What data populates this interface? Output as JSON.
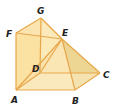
{
  "diagram": {
    "type": "3d-solid-geometry",
    "colors": {
      "edge": "#e8a74a",
      "face_light": "#fbe6b4",
      "face_mid": "#f7d48a",
      "face_dark": "#e9c36a",
      "face_shadow": "#d8bb6a",
      "label": "#222222"
    },
    "vertices": {
      "A": {
        "label": "A",
        "x": 16,
        "y": 90
      },
      "B": {
        "label": "B",
        "x": 75,
        "y": 90
      },
      "C": {
        "label": "C",
        "x": 100,
        "y": 73
      },
      "D": {
        "label": "D",
        "x": 40,
        "y": 73
      },
      "E": {
        "label": "E",
        "x": 62,
        "y": 39
      },
      "F": {
        "label": "F",
        "x": 16,
        "y": 33
      },
      "G": {
        "label": "G",
        "x": 41,
        "y": 18
      }
    },
    "labels": [
      {
        "id": "G",
        "text": "G",
        "x": 37,
        "y": 14
      },
      {
        "id": "F",
        "text": "F",
        "x": 6,
        "y": 37
      },
      {
        "id": "E",
        "text": "E",
        "x": 62,
        "y": 36
      },
      {
        "id": "D",
        "text": "D",
        "x": 32,
        "y": 72
      },
      {
        "id": "C",
        "text": "C",
        "x": 103,
        "y": 78
      },
      {
        "id": "A",
        "text": "A",
        "x": 11,
        "y": 103
      },
      {
        "id": "B",
        "text": "B",
        "x": 72,
        "y": 104
      }
    ]
  }
}
